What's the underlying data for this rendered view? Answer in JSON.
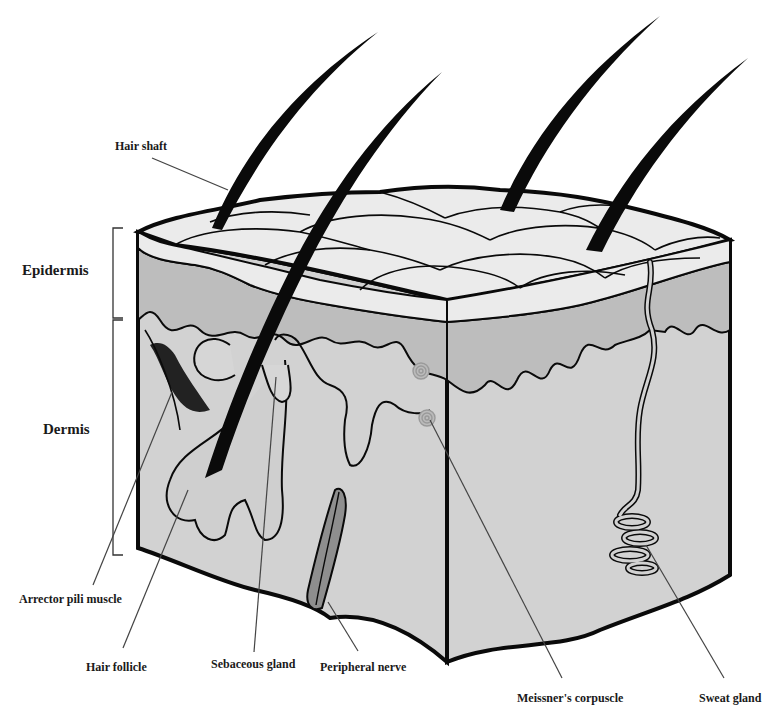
{
  "figure": {
    "colors": {
      "background": "#ffffff",
      "epidermis_surface": "#ebebeb",
      "epidermis_layer": "#bdbdbd",
      "dermis": "#d2d2d2",
      "outline": "#0a0a0a",
      "nerve": "#8e8e8e",
      "corpuscle": "#a9a9a9",
      "leader_line": "#444444"
    },
    "layers": [
      {
        "label": "Epidermis"
      },
      {
        "label": "Dermis"
      }
    ],
    "structures": [
      {
        "label": "Hair shaft"
      },
      {
        "label": "Arrector pili muscle"
      },
      {
        "label": "Hair follicle"
      },
      {
        "label": "Sebaceous gland"
      },
      {
        "label": "Peripheral nerve"
      },
      {
        "label": "Meissner's corpuscle"
      },
      {
        "label": "Sweat gland"
      }
    ]
  }
}
